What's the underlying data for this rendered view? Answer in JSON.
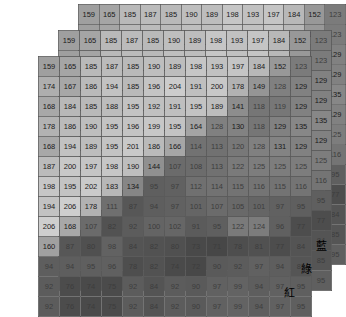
{
  "figure": {
    "title": ""
  },
  "labels": {
    "blue": "藍",
    "green": "綠",
    "red": "紅"
  },
  "grid": {
    "rows": 13,
    "cols": 13,
    "cell_width": 20,
    "cell_height": 19,
    "value_min": 0,
    "value_max": 255
  },
  "chart_data": {
    "type": "heatmap",
    "title": "",
    "xlabel": "",
    "ylabel": "",
    "grid": true,
    "legend": "none",
    "colormap": "grayscale",
    "vmin": 0,
    "vmax": 255,
    "layers": [
      {
        "name": "藍",
        "channel": "blue",
        "offset": [
          78,
          4
        ],
        "values": [
          [
            159,
            165,
            185,
            187,
            185,
            190,
            189,
            198,
            193,
            197,
            184,
            152,
            123
          ],
          [
            159,
            165,
            185,
            187,
            185,
            190,
            189,
            198,
            193,
            197,
            184,
            152,
            123
          ],
          [
            174,
            167,
            186,
            194,
            185,
            196,
            204,
            191,
            200,
            178,
            149,
            128,
            129
          ],
          [
            168,
            184,
            185,
            188,
            195,
            192,
            191,
            195,
            189,
            141,
            118,
            119,
            129
          ],
          [
            178,
            186,
            190,
            195,
            196,
            199,
            195,
            164,
            128,
            130,
            118,
            129,
            135
          ],
          [
            168,
            194,
            189,
            195,
            201,
            186,
            166,
            114,
            113,
            120,
            128,
            131,
            129
          ],
          [
            187,
            200,
            197,
            198,
            190,
            144,
            107,
            108,
            113,
            122,
            125,
            125,
            125
          ],
          [
            198,
            195,
            202,
            183,
            134,
            95,
            97,
            112,
            114,
            115,
            116,
            115,
            116
          ],
          [
            194,
            206,
            178,
            111,
            87,
            94,
            97,
            101,
            107,
            105,
            101,
            97,
            95
          ],
          [
            206,
            168,
            107,
            82,
            92,
            100,
            102,
            91,
            95,
            122,
            124,
            96,
            77
          ],
          [
            160,
            87,
            80,
            98,
            84,
            82,
            80,
            73,
            71,
            78,
            81,
            77,
            84
          ],
          [
            94,
            94,
            95,
            96,
            78,
            82,
            74,
            72,
            90,
            92,
            97,
            94,
            85
          ],
          [
            92,
            76,
            74,
            75,
            92,
            84,
            92,
            90,
            97,
            99,
            94,
            97,
            95
          ]
        ]
      },
      {
        "name": "綠",
        "channel": "green",
        "offset": [
          58,
          30
        ],
        "values": [
          [
            159,
            165,
            185,
            187,
            185,
            190,
            189,
            198,
            193,
            197,
            184,
            152,
            123
          ],
          [
            159,
            165,
            185,
            187,
            185,
            190,
            189,
            198,
            193,
            197,
            184,
            152,
            123
          ],
          [
            174,
            167,
            186,
            194,
            185,
            196,
            204,
            191,
            200,
            178,
            149,
            128,
            129
          ],
          [
            168,
            184,
            185,
            188,
            195,
            192,
            191,
            195,
            189,
            141,
            118,
            119,
            129
          ],
          [
            178,
            186,
            190,
            195,
            196,
            199,
            195,
            164,
            128,
            130,
            118,
            129,
            135
          ],
          [
            168,
            194,
            189,
            195,
            201,
            186,
            166,
            114,
            113,
            120,
            128,
            131,
            129
          ],
          [
            187,
            200,
            197,
            198,
            190,
            144,
            107,
            108,
            113,
            122,
            125,
            125,
            125
          ],
          [
            198,
            195,
            202,
            183,
            134,
            95,
            97,
            112,
            114,
            115,
            116,
            115,
            116
          ],
          [
            194,
            206,
            178,
            111,
            87,
            94,
            97,
            101,
            107,
            105,
            101,
            97,
            95
          ],
          [
            206,
            168,
            107,
            82,
            92,
            100,
            102,
            91,
            95,
            122,
            124,
            96,
            77
          ],
          [
            160,
            87,
            80,
            98,
            84,
            82,
            80,
            73,
            71,
            78,
            81,
            77,
            84
          ],
          [
            94,
            94,
            95,
            96,
            78,
            82,
            74,
            72,
            90,
            92,
            97,
            94,
            85
          ],
          [
            92,
            76,
            74,
            75,
            92,
            84,
            92,
            90,
            97,
            99,
            94,
            97,
            95
          ]
        ]
      },
      {
        "name": "紅",
        "channel": "red",
        "offset": [
          38,
          56
        ],
        "values": [
          [
            159,
            165,
            185,
            187,
            185,
            190,
            189,
            198,
            193,
            197,
            184,
            152,
            123
          ],
          [
            174,
            167,
            186,
            194,
            185,
            196,
            204,
            191,
            200,
            178,
            149,
            128,
            129
          ],
          [
            168,
            184,
            185,
            188,
            195,
            192,
            191,
            195,
            189,
            141,
            118,
            119,
            129
          ],
          [
            178,
            186,
            190,
            195,
            196,
            199,
            195,
            164,
            128,
            130,
            118,
            129,
            135
          ],
          [
            168,
            194,
            189,
            195,
            201,
            186,
            166,
            114,
            113,
            120,
            128,
            131,
            129
          ],
          [
            187,
            200,
            197,
            198,
            190,
            144,
            107,
            108,
            113,
            122,
            125,
            125,
            125
          ],
          [
            198,
            195,
            202,
            183,
            134,
            95,
            97,
            112,
            114,
            115,
            116,
            115,
            116
          ],
          [
            194,
            206,
            178,
            111,
            87,
            94,
            97,
            101,
            107,
            105,
            101,
            97,
            95
          ],
          [
            206,
            168,
            107,
            82,
            92,
            100,
            102,
            91,
            95,
            122,
            124,
            96,
            77
          ],
          [
            160,
            87,
            80,
            98,
            84,
            82,
            80,
            73,
            71,
            78,
            81,
            77,
            84
          ],
          [
            94,
            94,
            95,
            96,
            78,
            82,
            74,
            72,
            90,
            92,
            97,
            94,
            85
          ],
          [
            92,
            76,
            74,
            75,
            92,
            84,
            92,
            90,
            97,
            99,
            94,
            97,
            95
          ],
          [
            92,
            76,
            74,
            75,
            92,
            84,
            92,
            90,
            97,
            99,
            94,
            97,
            95
          ]
        ]
      }
    ]
  }
}
